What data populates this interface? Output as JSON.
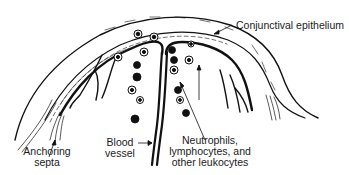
{
  "diagram": {
    "labels": {
      "conjunctival_epithelium": "Conjunctival epithelium",
      "anchoring_septa_line1": "Anchoring",
      "anchoring_septa_line2": "septa",
      "blood_vessel_line1": "Blood",
      "blood_vessel_line2": "vessel",
      "leukocytes_line1": "Neutrophils,",
      "leukocytes_line2": "lymphocytes, and",
      "leukocytes_line3": "other leukocytes"
    },
    "colors": {
      "ink": "#111111",
      "background": "#ffffff"
    }
  }
}
